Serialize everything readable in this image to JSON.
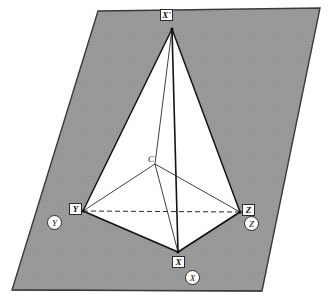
{
  "figure": {
    "background_color": "#ffffff",
    "plane_fill_color": "#9a9a9a",
    "plane_edge_color": "#3a3a3a",
    "solid_edge_color": "#1a1a1a",
    "hidden_edge_style": "dashed",
    "plane": {
      "name": "shaded-parallelogram",
      "corners": [
        {
          "x": 98,
          "y": 11
        },
        {
          "x": 320,
          "y": 8
        },
        {
          "x": 262,
          "y": 291
        },
        {
          "x": 12,
          "y": 290
        }
      ]
    },
    "vertices": [
      {
        "id": "apex",
        "label": "X'",
        "x": 172,
        "y": 29,
        "label_x": 163,
        "label_y": 11
      },
      {
        "id": "left",
        "label": "Y",
        "x": 83,
        "y": 211,
        "label_x": 71,
        "label_y": 203
      },
      {
        "id": "right",
        "label": "Z",
        "x": 240,
        "y": 212,
        "label_x": 243,
        "label_y": 204
      },
      {
        "id": "bottom",
        "label": "X",
        "x": 178,
        "y": 252,
        "label_x": 172,
        "label_y": 257
      },
      {
        "id": "center",
        "label": "C",
        "x": 155,
        "y": 164,
        "label_x": 150,
        "label_y": 157
      }
    ],
    "edges": [
      {
        "from": "apex",
        "to": "left",
        "hidden": false
      },
      {
        "from": "apex",
        "to": "right",
        "hidden": false
      },
      {
        "from": "apex",
        "to": "bottom",
        "hidden": false
      },
      {
        "from": "left",
        "to": "bottom",
        "hidden": false
      },
      {
        "from": "right",
        "to": "bottom",
        "hidden": false
      },
      {
        "from": "left",
        "to": "right",
        "hidden": true
      }
    ],
    "center_rays": [
      {
        "from": "center",
        "to": "apex"
      },
      {
        "from": "center",
        "to": "left"
      },
      {
        "from": "center",
        "to": "right"
      },
      {
        "from": "center",
        "to": "bottom"
      }
    ],
    "circled_labels": [
      {
        "id": "circle-y",
        "label": "Y",
        "x": 47,
        "y": 215
      },
      {
        "id": "circle-z",
        "label": "Z",
        "x": 244,
        "y": 216
      },
      {
        "id": "circle-x",
        "label": "X",
        "x": 185,
        "y": 270
      }
    ]
  }
}
